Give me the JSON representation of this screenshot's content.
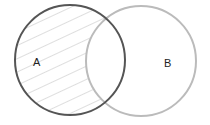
{
  "diagram": {
    "type": "venn",
    "shaded_region": "A only (A minus B)",
    "sets": [
      {
        "label": "A",
        "stroke": "#555555",
        "shaded": true
      },
      {
        "label": "B",
        "stroke": "#bbbbbb",
        "shaded": false
      }
    ],
    "hatch_color": "#c8c8c8"
  }
}
